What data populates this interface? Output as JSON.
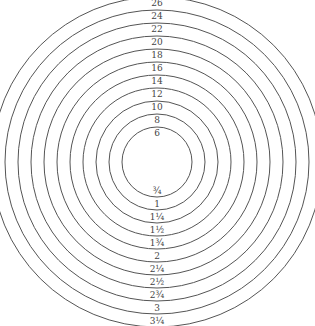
{
  "diagram": {
    "type": "concentric-ring-size-chart",
    "stroke_color": "#555555",
    "text_color": "#444444",
    "background": "#ffffff",
    "center": {
      "x": 157,
      "y": 162
    },
    "inner_radius": 35,
    "ring_step": 13,
    "rings": [
      {
        "top_label": "6",
        "bottom_label": "¾"
      },
      {
        "top_label": "8",
        "bottom_label": "1"
      },
      {
        "top_label": "10",
        "bottom_label": "1¼"
      },
      {
        "top_label": "12",
        "bottom_label": "1½"
      },
      {
        "top_label": "14",
        "bottom_label": "1¾"
      },
      {
        "top_label": "16",
        "bottom_label": "2"
      },
      {
        "top_label": "18",
        "bottom_label": "2¼"
      },
      {
        "top_label": "20",
        "bottom_label": "2½"
      },
      {
        "top_label": "22",
        "bottom_label": "2¾"
      },
      {
        "top_label": "24",
        "bottom_label": "3"
      },
      {
        "top_label": "26",
        "bottom_label": "3¼"
      }
    ]
  }
}
